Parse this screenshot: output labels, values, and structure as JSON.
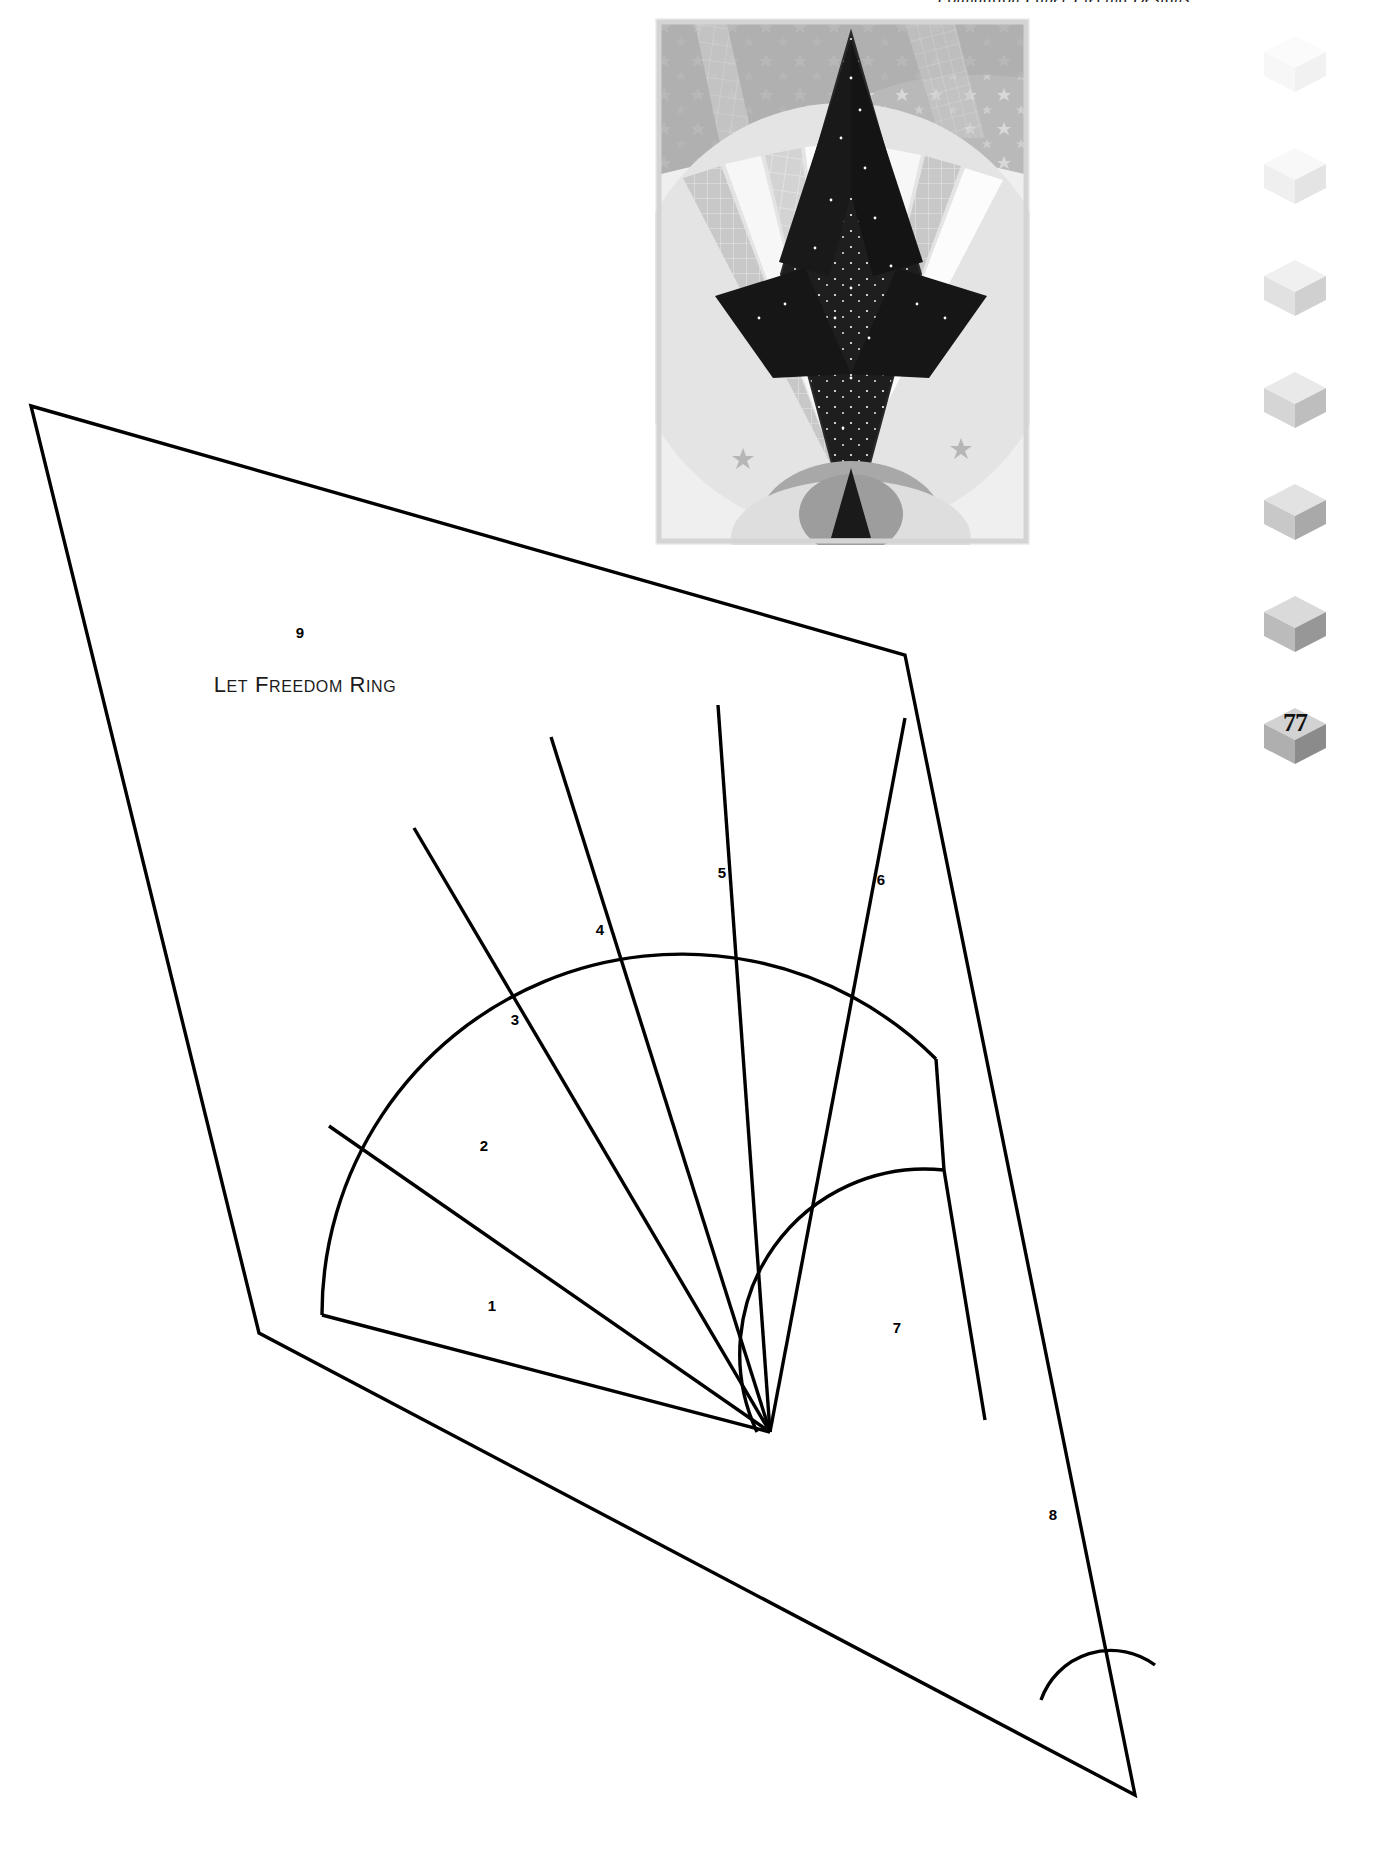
{
  "running_head": {
    "text": "Foundation Paper Piecing Designs"
  },
  "photo": {
    "name": "quilt-block-photo",
    "alt_description": "Grayscale photo of a pieced star and rays quilt block",
    "palette": {
      "background": "#f4f4f4",
      "dark": "#1c1c1c",
      "mid_gray": "#b4b4b4",
      "light_gray": "#dcdcdc",
      "pale": "#ececec",
      "white": "#fdfdfd",
      "accent_gray": "#9a9a9a"
    }
  },
  "page_marker": {
    "page_number": "77",
    "cube_count": 7,
    "cube_shades": [
      {
        "top": "#fbfbfb",
        "left": "#f7f7f7",
        "right": "#f1f1f1"
      },
      {
        "top": "#f8f8f8",
        "left": "#f0f0f0",
        "right": "#e6e6e6"
      },
      {
        "top": "#f0f0f0",
        "left": "#e2e2e2",
        "right": "#d2d2d2"
      },
      {
        "top": "#e9e9e9",
        "left": "#d6d6d6",
        "right": "#c0c0c0"
      },
      {
        "top": "#e2e2e2",
        "left": "#c9c9c9",
        "right": "#ababab"
      },
      {
        "top": "#dadada",
        "left": "#bcbcbc",
        "right": "#999999"
      },
      {
        "top": "#d2d2d2",
        "left": "#b0b0b0",
        "right": "#8c8c8c"
      }
    ]
  },
  "pattern": {
    "name": "let-freedom-ring-block",
    "title": "LET FREEDOM RING",
    "title_display": {
      "caps": [
        "L",
        "F",
        "R"
      ],
      "rest": [
        "ET",
        "REEDOM",
        "ING"
      ]
    },
    "stroke_color": "#000000",
    "fill_color": "#ffffff",
    "section_labels": [
      {
        "id": "1",
        "label": "1",
        "x": 492,
        "y": 1305
      },
      {
        "id": "2",
        "label": "2",
        "x": 484,
        "y": 1145
      },
      {
        "id": "3",
        "label": "3",
        "x": 515,
        "y": 1019
      },
      {
        "id": "4",
        "label": "4",
        "x": 600,
        "y": 929
      },
      {
        "id": "5",
        "label": "5",
        "x": 722,
        "y": 872
      },
      {
        "id": "6",
        "label": "6",
        "x": 881,
        "y": 879
      },
      {
        "id": "7",
        "label": "7",
        "x": 897,
        "y": 1327
      },
      {
        "id": "8",
        "label": "8",
        "x": 1053,
        "y": 1514
      },
      {
        "id": "9",
        "label": "9",
        "x": 300,
        "y": 632
      }
    ],
    "title_position": {
      "x": 305,
      "y": 685
    }
  }
}
